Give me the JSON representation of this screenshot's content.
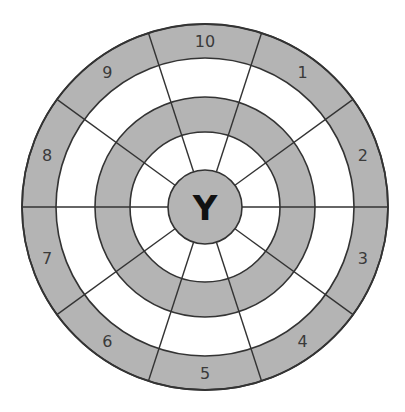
{
  "diagram": {
    "title": "",
    "center_label": "Y",
    "sector_labels": [
      "1",
      "2",
      "3",
      "4",
      "5",
      "6",
      "7",
      "8",
      "9",
      "10"
    ],
    "sector_count": 10,
    "rings": [
      {
        "name": "center",
        "fill": "#b4b4b4"
      },
      {
        "name": "ring-1",
        "fill": "#ffffff"
      },
      {
        "name": "ring-2",
        "fill": "#b4b4b4"
      },
      {
        "name": "ring-3",
        "fill": "#ffffff"
      },
      {
        "name": "ring-4",
        "fill": "#b4b4b4"
      }
    ],
    "colors": {
      "shaded": "#b4b4b4",
      "unshaded": "#ffffff",
      "line": "#333333",
      "text": "#3a3a3a"
    }
  }
}
